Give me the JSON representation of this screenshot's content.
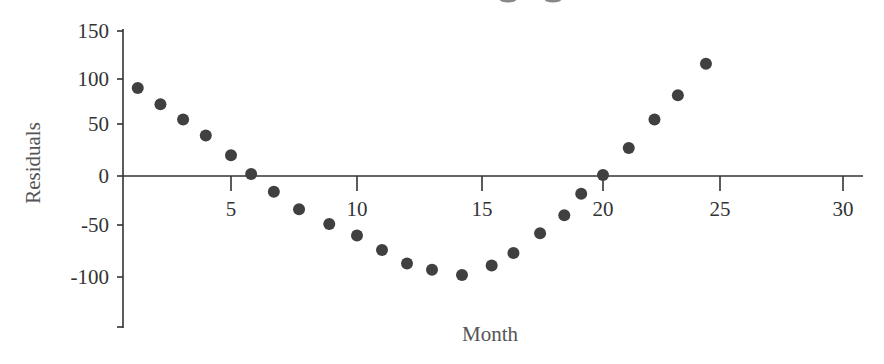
{
  "chart_data": {
    "type": "scatter",
    "title": "",
    "xlabel": "Month",
    "ylabel": "Residuals",
    "xlim": [
      0.7,
      31
    ],
    "ylim": [
      -150,
      150
    ],
    "x_ticks": [
      5,
      10,
      15,
      20,
      25,
      30
    ],
    "x_tick_labels": [
      "5",
      "10",
      "15",
      "20",
      "25",
      "30"
    ],
    "y_ticks": [
      150,
      100,
      50,
      0,
      -50,
      -100,
      -150
    ],
    "y_tick_labels": [
      "150",
      "100",
      "50",
      "0",
      "-50",
      "-100",
      ""
    ],
    "grid": false,
    "legend": null,
    "marker_color": "#404040",
    "series": [
      {
        "name": "Residuals",
        "x": [
          1.3,
          2.2,
          3.1,
          4.0,
          5.0,
          5.8,
          6.7,
          7.7,
          8.9,
          10.0,
          11.0,
          12.0,
          13.0,
          14.2,
          15.4,
          16.3,
          17.4,
          18.4,
          19.1,
          20.0,
          21.1,
          22.2,
          23.2,
          24.4
        ],
        "y": [
          90,
          72,
          55,
          39,
          20,
          2,
          -16,
          -34,
          -49,
          -60,
          -74,
          -87,
          -93,
          -98,
          -89,
          -77,
          -58,
          -40,
          -18,
          1,
          27,
          55,
          82,
          116
        ]
      }
    ]
  }
}
